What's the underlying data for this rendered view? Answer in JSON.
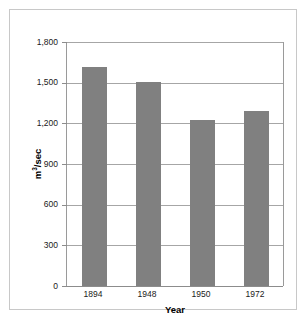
{
  "chart_data": {
    "type": "bar",
    "title": "",
    "subtitle": "",
    "categories": [
      "1894",
      "1948",
      "1950",
      "1972"
    ],
    "values": [
      1615,
      1505,
      1225,
      1290
    ],
    "xlabel": "Year",
    "ylabel": "m³/sec",
    "ylabel_base": "m",
    "ylabel_exponent": "3",
    "ylabel_suffix": "/sec",
    "ylim": [
      0,
      1800
    ],
    "ytick_values": [
      0,
      300,
      600,
      900,
      1200,
      1500,
      1800
    ],
    "ytick_labels": [
      "0",
      "300",
      "600",
      "900",
      "1,200",
      "1,500",
      "1,800"
    ],
    "grid": true,
    "grid_axis": "y",
    "legend": false,
    "legend_position": "none",
    "bar_color": "#808080",
    "axis_color": "#9a9a9a",
    "grid_color": "#a6a6a6",
    "frame_color": "#c8c8c8",
    "background_color": "#ffffff",
    "text_color": "#1a1a1a"
  }
}
